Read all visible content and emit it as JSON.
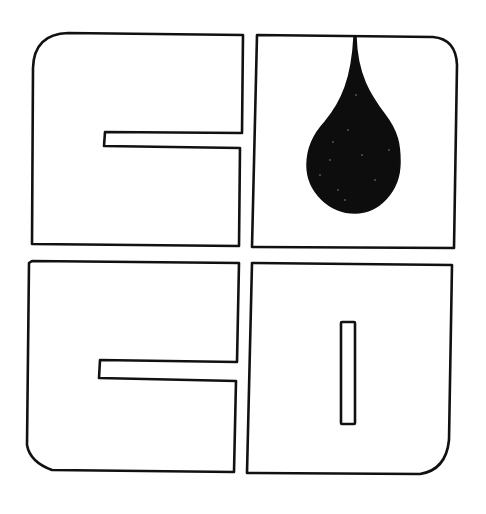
{
  "logo": {
    "description": "Four-quadrant square logo with stylized letter outlines and a black oil/water droplet",
    "colors": {
      "background": "#ffffff",
      "stroke": "#111111",
      "droplet": "#0d0d0d"
    },
    "quadrants": [
      {
        "position": "top-left",
        "shape": "letter-c-outline",
        "rounded_corner": "top-left"
      },
      {
        "position": "top-right",
        "shape": "square-outline-with-droplet",
        "rounded_corner": "top-right"
      },
      {
        "position": "bottom-left",
        "shape": "letter-c-outline",
        "rounded_corner": "bottom-left"
      },
      {
        "position": "bottom-right",
        "shape": "letter-d-outline-with-slot",
        "rounded_corner": "bottom-right"
      }
    ],
    "icons": [
      "droplet-icon"
    ]
  }
}
